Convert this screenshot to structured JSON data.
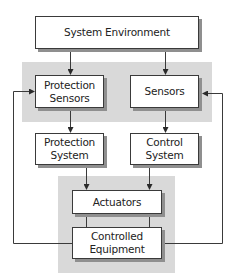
{
  "diagram": {
    "type": "block-diagram",
    "nodes": {
      "system_environment": "System Environment",
      "protection_sensors": "Protection\nSensors",
      "sensors": "Sensors",
      "protection_system": "Protection\nSystem",
      "control_system": "Control\nSystem",
      "actuators": "Actuators",
      "controlled_equipment": "Controlled\nEquipment"
    },
    "edges": [
      {
        "from": "System Environment",
        "to": "Protection Sensors"
      },
      {
        "from": "System Environment",
        "to": "Sensors"
      },
      {
        "from": "Protection Sensors",
        "to": "Protection System"
      },
      {
        "from": "Sensors",
        "to": "Control System"
      },
      {
        "from": "Protection System",
        "to": "Actuators"
      },
      {
        "from": "Control System",
        "to": "Actuators"
      },
      {
        "from": "Actuators",
        "to": "Controlled Equipment",
        "arrow": false
      },
      {
        "from": "Controlled Equipment",
        "to": "Protection Sensors",
        "type": "feedback"
      },
      {
        "from": "Controlled Equipment",
        "to": "Sensors",
        "type": "feedback"
      }
    ],
    "groups": [
      {
        "name": "sensing-group",
        "members": [
          "Protection Sensors",
          "Sensors"
        ]
      },
      {
        "name": "actuation-group",
        "members": [
          "Actuators",
          "Controlled Equipment"
        ]
      }
    ],
    "colors": {
      "group_background": "#d9d9d9",
      "box_border": "#3a3a3a",
      "box_shadow": "#8f8f8f",
      "line": "#3a3a3a"
    }
  }
}
